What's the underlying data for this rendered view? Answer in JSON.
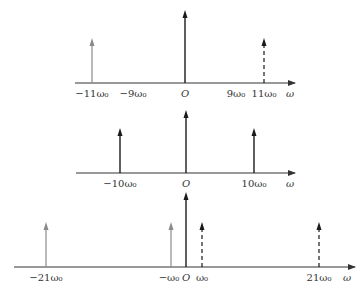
{
  "panels": [
    {
      "name": "top-spectrum",
      "axis": {
        "x1": 75,
        "x2": 295,
        "y": 83,
        "label": "ω"
      },
      "origin_label": "O",
      "stems": [
        {
          "x": 92,
          "top": 38,
          "style": "gray",
          "label": "−11ω₀"
        },
        {
          "x": 185,
          "top": 10,
          "style": "solid",
          "label": ""
        },
        {
          "x": 264,
          "top": 38,
          "style": "dashed",
          "label": "11ω₀"
        }
      ],
      "tick_labels": [
        {
          "x": 92,
          "text": "−11ω₀"
        },
        {
          "x": 133,
          "text": "−9ω₀"
        },
        {
          "x": 185,
          "text": "O"
        },
        {
          "x": 236,
          "text": "9ω₀"
        },
        {
          "x": 264,
          "text": "11ω₀"
        },
        {
          "x": 290,
          "text": "ω"
        }
      ]
    },
    {
      "name": "middle-spectrum",
      "axis": {
        "x1": 76,
        "x2": 295,
        "y": 173,
        "label": "ω"
      },
      "origin_label": "O",
      "stems": [
        {
          "x": 120,
          "top": 128,
          "style": "solid",
          "label": "−10ω₀"
        },
        {
          "x": 186,
          "top": 110,
          "style": "solid",
          "label": ""
        },
        {
          "x": 254,
          "top": 128,
          "style": "solid",
          "label": "10ω₀"
        }
      ],
      "tick_labels": [
        {
          "x": 120,
          "text": "−10ω₀"
        },
        {
          "x": 186,
          "text": "O"
        },
        {
          "x": 254,
          "text": "10ω₀"
        },
        {
          "x": 290,
          "text": "ω"
        }
      ]
    },
    {
      "name": "bottom-spectrum",
      "axis": {
        "x1": 14,
        "x2": 355,
        "y": 267,
        "label": "ω"
      },
      "origin_label": "O",
      "stems": [
        {
          "x": 46,
          "top": 222,
          "style": "gray",
          "label": "−21ω₀"
        },
        {
          "x": 171,
          "top": 222,
          "style": "gray",
          "label": "−ω₀"
        },
        {
          "x": 186,
          "top": 192,
          "style": "solid",
          "label": ""
        },
        {
          "x": 202,
          "top": 222,
          "style": "dashed",
          "label": "ω₀"
        },
        {
          "x": 319,
          "top": 222,
          "style": "dashed",
          "label": "21ω₀"
        }
      ],
      "tick_labels": [
        {
          "x": 46,
          "text": "−21ω₀"
        },
        {
          "x": 169,
          "text": "−ω₀"
        },
        {
          "x": 186,
          "text": "O"
        },
        {
          "x": 202,
          "text": "ω₀"
        },
        {
          "x": 319,
          "text": "21ω₀"
        },
        {
          "x": 347,
          "text": "ω"
        }
      ]
    }
  ],
  "colors": {
    "solid": "#1a1a1a",
    "gray": "#8a8a8a",
    "dashed": "#1a1a1a",
    "axis": "#333333"
  }
}
